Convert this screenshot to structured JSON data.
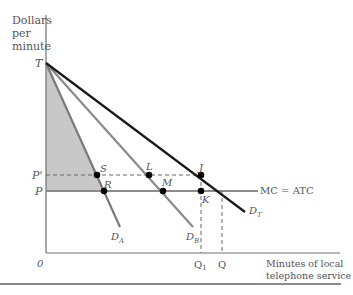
{
  "diagram": {
    "type": "economics-demand-diagram",
    "y_axis_label": [
      "Dollars",
      "per",
      "minute"
    ],
    "x_axis_label": [
      "Minutes of local",
      "telephone service"
    ],
    "origin_label": "0",
    "price_labels": {
      "T": "T",
      "P_prime": "P'",
      "P": "P"
    },
    "quantity_labels": {
      "Q1": "Q",
      "Q1_sub": "1",
      "Q": "Q"
    },
    "curves": {
      "DA": {
        "label": "D",
        "sub": "A"
      },
      "DB": {
        "label": "D",
        "sub": "B"
      },
      "DT": {
        "label": "D",
        "sub": "T"
      },
      "mc": "MC = ATC"
    },
    "points": {
      "S": "S",
      "R": "R",
      "L": "L",
      "M": "M",
      "J": "J",
      "K": "K"
    },
    "colors": {
      "axis": "#6e6e6e",
      "total_demand": "#1a1a1a",
      "individual_demand": "#7a7a7a",
      "mc_line": "#8c8c8c",
      "shaded_region": "#c8c8c8",
      "points": "#000000"
    }
  }
}
